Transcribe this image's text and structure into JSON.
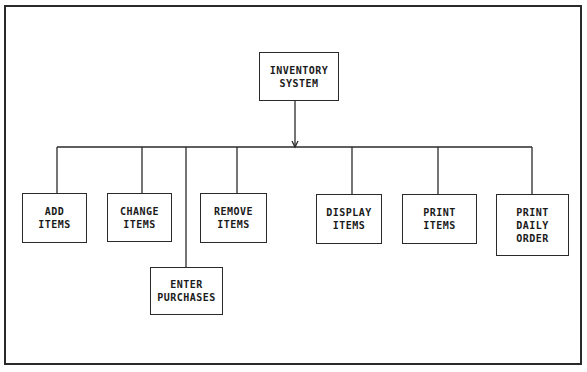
{
  "diagram": {
    "type": "hierarchy-chart",
    "root": {
      "id": "inventory-system",
      "label": "INVENTORY\nSYSTEM"
    },
    "children": [
      {
        "id": "add-items",
        "label": "ADD\nITEMS"
      },
      {
        "id": "change-items",
        "label": "CHANGE\nITEMS"
      },
      {
        "id": "enter-purchases",
        "label": "ENTER\nPURCHASES"
      },
      {
        "id": "remove-items",
        "label": "REMOVE\nITEMS"
      },
      {
        "id": "display-items",
        "label": "DISPLAY\nITEMS"
      },
      {
        "id": "print-items",
        "label": "PRINT\nITEMS"
      },
      {
        "id": "print-daily-order",
        "label": "PRINT\nDAILY\nORDER"
      }
    ],
    "colors": {
      "line": "#2a2a2a",
      "background": "#ffffff",
      "text": "#1a1a1a"
    }
  }
}
